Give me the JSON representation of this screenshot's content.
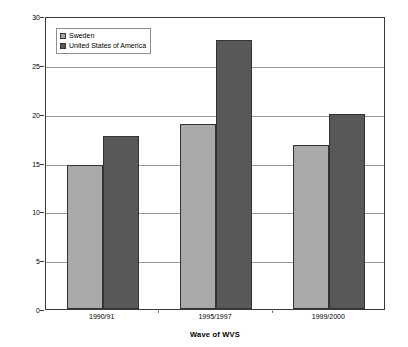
{
  "chart_data": {
    "type": "bar",
    "title": "",
    "subtitle": "",
    "xlabel": "Wave of WVS",
    "ylabel": "Percent",
    "categories": [
      "1990/91",
      "1995/1997",
      "1999/2000"
    ],
    "series": [
      {
        "name": "Sweden",
        "color": "#a9a9a9",
        "values": [
          14.7,
          18.9,
          16.8
        ]
      },
      {
        "name": "United States of America",
        "color": "#585858",
        "values": [
          17.7,
          27.5,
          20.0
        ]
      }
    ],
    "ylim": [
      0,
      30
    ],
    "ytick_step": 5,
    "yticks": [
      0,
      5,
      10,
      15,
      20,
      25,
      30
    ],
    "ytick_labels": [
      "0",
      "5",
      "10",
      "15",
      "20",
      "25",
      "30"
    ],
    "grid": true,
    "grid_axis": "y",
    "legend_position": "top-left-inside",
    "legend_border": true,
    "bar_border_color": "#333333",
    "plot_border_color": "#3a3a3a",
    "gridline_color": "#9a9a9a",
    "background_color": "#ffffff"
  }
}
